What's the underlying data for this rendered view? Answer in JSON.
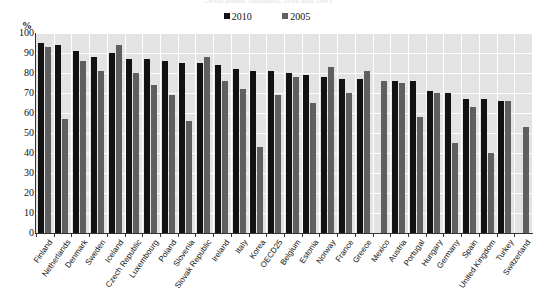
{
  "chart_data": {
    "type": "bar",
    "title": "...with public subsidies, 2010 and 2005",
    "xlabel": "",
    "ylabel": "%",
    "ylim": [
      0,
      100
    ],
    "ytick_step": 10,
    "yticks": [
      100,
      90,
      80,
      70,
      60,
      50,
      40,
      30,
      20,
      10,
      0
    ],
    "grid": true,
    "legend_position": "top-center",
    "categories": [
      "Finland",
      "Netherlands",
      "Denmark",
      "Sweden",
      "Iceland",
      "Czech Republic",
      "Luxembourg",
      "Poland",
      "Slovenia",
      "Slovak Republic",
      "Ireland",
      "Italy",
      "Korea",
      "OECD25",
      "Belgium",
      "Estonia",
      "Norway",
      "France",
      "Greece",
      "Mexico",
      "Austria",
      "Portugal",
      "Hungary",
      "Germany",
      "Spain",
      "United Kingdom",
      "Turkey",
      "Switzerland"
    ],
    "series": [
      {
        "name": "2010",
        "color": "#121212",
        "values": [
          95,
          94,
          91,
          88,
          90,
          87,
          87,
          86,
          85,
          85,
          84,
          82,
          81,
          81,
          80,
          79,
          78,
          77,
          77,
          null,
          76,
          76,
          71,
          70,
          67,
          67,
          66,
          null
        ]
      },
      {
        "name": "2005",
        "color": "#5f5f5f",
        "values": [
          93,
          57,
          86,
          81,
          94,
          80,
          74,
          69,
          56,
          88,
          76,
          72,
          43,
          69,
          78,
          65,
          83,
          70,
          81,
          76,
          75,
          58,
          70,
          45,
          63,
          40,
          66,
          53
        ]
      }
    ]
  },
  "legend": {
    "items": [
      {
        "label": "2010",
        "color": "#121212"
      },
      {
        "label": "2005",
        "color": "#5f5f5f"
      }
    ]
  },
  "axis": {
    "y_unit_label": "%"
  }
}
